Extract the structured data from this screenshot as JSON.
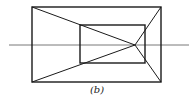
{
  "figure": {
    "caption": "(b)",
    "stroke_color": "#1a1a1a",
    "horizon_color": "#555555",
    "outer_rect": {
      "x": 32,
      "y": 7,
      "width": 129,
      "height": 75
    },
    "inner_rect": {
      "x": 80,
      "y": 25,
      "width": 65,
      "height": 38
    },
    "horizon_line": {
      "x1": 9,
      "y1": 45,
      "x2": 189,
      "y2": 45
    },
    "vanishing_point": {
      "x": 135,
      "y": 45
    },
    "rays": [
      {
        "from": "outer-top-left",
        "x1": 32,
        "y1": 7,
        "x2": 135,
        "y2": 45
      },
      {
        "from": "outer-bottom-left",
        "x1": 32,
        "y1": 82,
        "x2": 135,
        "y2": 45
      },
      {
        "from": "outer-top-right",
        "x1": 161,
        "y1": 7,
        "x2": 135,
        "y2": 45
      },
      {
        "from": "outer-bottom-right",
        "x1": 161,
        "y1": 82,
        "x2": 135,
        "y2": 45
      }
    ]
  }
}
